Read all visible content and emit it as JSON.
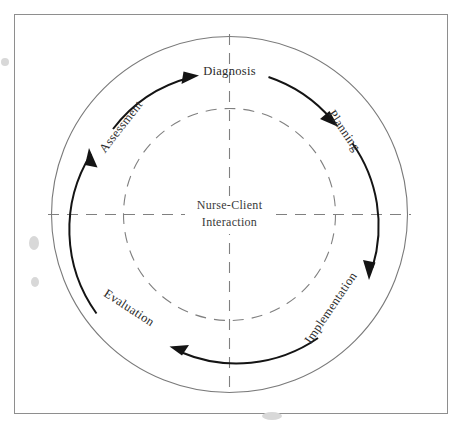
{
  "figure": {
    "type": "cycle-diagram",
    "center_label_line1": "Nurse-Client",
    "center_label_line2": "Interaction",
    "stages": [
      {
        "id": "assessment",
        "label": "Assessment",
        "position": "upper-left",
        "angle_deg": -125,
        "rotation_deg": -52
      },
      {
        "id": "diagnosis",
        "label": "Diagnosis",
        "position": "top",
        "angle_deg": -90,
        "rotation_deg": 0
      },
      {
        "id": "planning",
        "label": "Planning",
        "position": "upper-right",
        "angle_deg": -50,
        "rotation_deg": 56
      },
      {
        "id": "implementation",
        "label": "Implementation",
        "position": "lower-right",
        "angle_deg": 50,
        "rotation_deg": -56
      },
      {
        "id": "evaluation",
        "label": "Evaluation",
        "position": "lower-left",
        "angle_deg": 128,
        "rotation_deg": 33
      }
    ],
    "direction": "clockwise",
    "arrow_count": 5,
    "rings": {
      "outer_radius": 178,
      "flow_radius": 143,
      "dashed_radius": 106
    },
    "colors": {
      "frame": "#8e8e8e",
      "ring": "#7a7a7a",
      "dashed": "#808080",
      "arrow": "#141414",
      "text": "#2a2a2a",
      "background": "#ffffff"
    }
  }
}
